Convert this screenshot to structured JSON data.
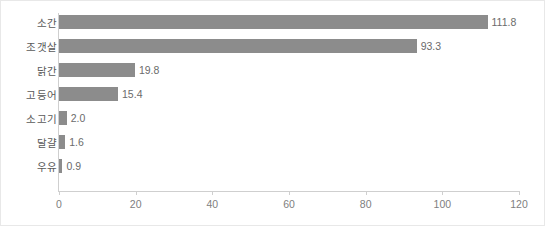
{
  "chart_data": {
    "type": "bar",
    "orientation": "horizontal",
    "title": "",
    "xlabel": "",
    "ylabel": "",
    "xlim": [
      0,
      120
    ],
    "xticks": [
      0,
      20,
      40,
      60,
      80,
      100,
      120
    ],
    "xtick_labels": [
      "0",
      "20",
      "40",
      "60",
      "80",
      "100",
      "120"
    ],
    "grid": false,
    "legend": false,
    "bar_color": "#8c8c8c",
    "axis_color": "#cfcfcf",
    "categories": [
      "소간",
      "조갯살",
      "닭간",
      "고등어",
      "소고기",
      "달걀",
      "우유"
    ],
    "values": [
      111.8,
      93.3,
      19.8,
      15.4,
      2.0,
      1.6,
      0.9
    ],
    "value_labels": [
      "111.8",
      "93.3",
      "19.8",
      "15.4",
      "2.0",
      "1.6",
      "0.9"
    ],
    "bars": [
      {
        "category": "소간",
        "value": 111.8,
        "label": "111.8"
      },
      {
        "category": "조갯살",
        "value": 93.3,
        "label": "93.3"
      },
      {
        "category": "닭간",
        "value": 19.8,
        "label": "19.8"
      },
      {
        "category": "고등어",
        "value": 15.4,
        "label": "15.4"
      },
      {
        "category": "소고기",
        "value": 2.0,
        "label": "2.0"
      },
      {
        "category": "달걀",
        "value": 1.6,
        "label": "1.6"
      },
      {
        "category": "우유",
        "value": 0.9,
        "label": "0.9"
      }
    ]
  }
}
